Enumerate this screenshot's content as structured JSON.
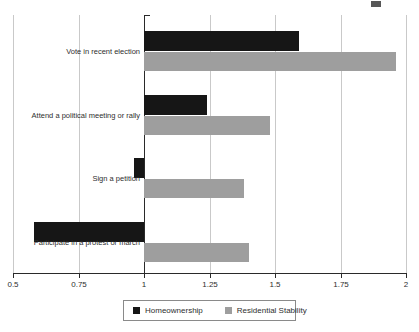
{
  "chart_data": {
    "type": "bar",
    "orientation": "horizontal",
    "baseline": 1,
    "categories": [
      "Vote in recent election",
      "Attend a political meeting or rally",
      "Sign a petition",
      "Participate in a protest or march"
    ],
    "series": [
      {
        "name": "Homeownership",
        "color": "#161616",
        "values": [
          1.59,
          1.24,
          0.96,
          0.58
        ]
      },
      {
        "name": "Residential Stability",
        "color": "#9e9e9e",
        "values": [
          1.96,
          1.48,
          1.38,
          1.4
        ]
      }
    ],
    "xlim": [
      0.5,
      2
    ],
    "xticks": [
      0.5,
      0.75,
      1,
      1.25,
      1.5,
      1.75,
      2
    ],
    "xtick_labels": [
      "0.5",
      "0.75",
      "1",
      "1.25",
      "1.5",
      "1.75",
      "2"
    ],
    "grid": true,
    "legend_position": "bottom",
    "title": "",
    "xlabel": "",
    "ylabel": ""
  },
  "legend": {
    "items": [
      {
        "label": "Homeownership",
        "color": "#161616"
      },
      {
        "label": "Residential Stability",
        "color": "#9e9e9e"
      }
    ]
  },
  "colors": {
    "background": "#ffffff",
    "gridline": "#c9c9c9",
    "axis": "#2a2a2a",
    "text": "#2e2e2e"
  }
}
